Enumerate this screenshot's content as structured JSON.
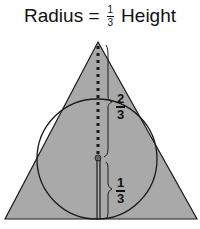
{
  "title": {
    "prefix": "Radius",
    "equals": "=",
    "fraction": {
      "numerator": "1",
      "denominator": "3"
    },
    "suffix": "Height"
  },
  "diagram": {
    "shape": "triangle-with-inscribed-circle",
    "fill_color": "#a9a9a9",
    "stroke_color": "#1a1a1a",
    "labels": {
      "upper": {
        "numerator": "2",
        "denominator": "3"
      },
      "lower": {
        "numerator": "1",
        "denominator": "3"
      }
    }
  }
}
